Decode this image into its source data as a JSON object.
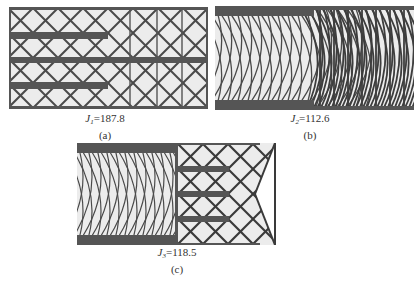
{
  "figure": {
    "panels": [
      {
        "id": "a",
        "label": "(a)",
        "objective_symbol": "J",
        "objective_subscript": "1",
        "objective_value": "187.8",
        "equals": "="
      },
      {
        "id": "b",
        "label": "(b)",
        "objective_symbol": "J",
        "objective_subscript": "2",
        "objective_value": "112.6",
        "equals": "="
      },
      {
        "id": "c",
        "label": "(c)",
        "objective_symbol": "J",
        "objective_subscript": "3",
        "objective_value": "118.5",
        "equals": "="
      }
    ],
    "colors": {
      "solid": "#555555",
      "lattice": "#4a4a4a",
      "fill": "#ececec",
      "caption": "#333333"
    }
  }
}
